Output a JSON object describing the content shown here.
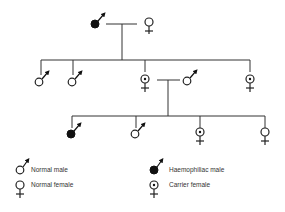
{
  "diagram": {
    "type": "pedigree",
    "generations": [
      {
        "generation": 1,
        "individuals": [
          {
            "id": "I-1",
            "sex": "male",
            "status": "haemophiliac"
          },
          {
            "id": "I-2",
            "sex": "female",
            "status": "normal"
          }
        ]
      },
      {
        "generation": 2,
        "individuals": [
          {
            "id": "II-1",
            "sex": "male",
            "status": "normal"
          },
          {
            "id": "II-2",
            "sex": "male",
            "status": "normal"
          },
          {
            "id": "II-3",
            "sex": "female",
            "status": "carrier"
          },
          {
            "id": "II-4",
            "sex": "male",
            "status": "normal",
            "note": "spouse of II-3"
          },
          {
            "id": "II-5",
            "sex": "female",
            "status": "carrier"
          }
        ]
      },
      {
        "generation": 3,
        "individuals": [
          {
            "id": "III-1",
            "sex": "male",
            "status": "haemophiliac"
          },
          {
            "id": "III-2",
            "sex": "male",
            "status": "normal"
          },
          {
            "id": "III-3",
            "sex": "female",
            "status": "carrier"
          },
          {
            "id": "III-4",
            "sex": "female",
            "status": "normal"
          }
        ]
      }
    ]
  },
  "legend": {
    "items": [
      {
        "symbol": "male-open",
        "label": "Normal male"
      },
      {
        "symbol": "female-open",
        "label": "Normal female"
      },
      {
        "symbol": "male-filled",
        "label": "Haemophiliac male"
      },
      {
        "symbol": "female-dot",
        "label": "Carrier female"
      }
    ]
  },
  "colors": {
    "line": "#222222",
    "fill": "#111111",
    "background": "#ffffff"
  }
}
